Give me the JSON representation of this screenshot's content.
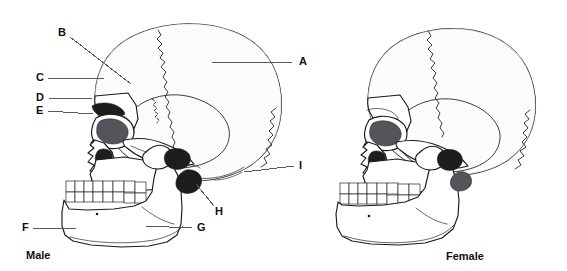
{
  "figure": {
    "background_color": "#ffffff",
    "ink_color": "#1a1a1a",
    "leader_color": "#5a5a5a"
  },
  "panels": [
    {
      "id": "male",
      "caption": "Male",
      "caption_x": 26,
      "caption_y": 256
    },
    {
      "id": "female",
      "caption": "Female",
      "caption_x": 446,
      "caption_y": 257
    }
  ],
  "labels": [
    {
      "key": "A",
      "text": "A",
      "x": 299,
      "y": 62,
      "anchor": "start",
      "line": "M292,62 L212,62"
    },
    {
      "key": "B",
      "text": "B",
      "x": 58,
      "y": 33,
      "anchor": "start",
      "line": "M70,37 L131,84"
    },
    {
      "key": "C",
      "text": "C",
      "x": 36,
      "y": 78,
      "anchor": "start",
      "line": "M48,78 L104,78"
    },
    {
      "key": "D",
      "text": "D",
      "x": 36,
      "y": 98,
      "anchor": "start",
      "line": "M48,98 L92,99"
    },
    {
      "key": "E",
      "text": "E",
      "x": 36,
      "y": 111,
      "anchor": "start",
      "line": "M48,111 L93,114"
    },
    {
      "key": "F",
      "text": "F",
      "x": 22,
      "y": 228,
      "anchor": "start",
      "line": "M33,228 L76,228"
    },
    {
      "key": "G",
      "text": "G",
      "x": 197,
      "y": 228,
      "anchor": "start",
      "line": "M192,228 L146,226"
    },
    {
      "key": "H",
      "text": "H",
      "x": 215,
      "y": 212,
      "anchor": "start",
      "line": "M214,206 L196,184"
    },
    {
      "key": "I",
      "text": "I",
      "x": 299,
      "y": 166,
      "anchor": "start",
      "line": "M294,166 L244,172"
    }
  ]
}
